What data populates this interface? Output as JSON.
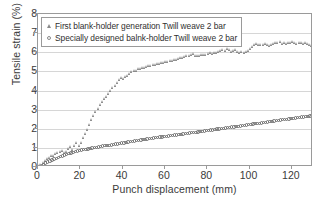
{
  "chart_data": {
    "type": "scatter",
    "title": "",
    "xlabel": "Punch displacement (mm)",
    "ylabel": "Tensile strain (%)",
    "xlim": [
      0,
      130
    ],
    "ylim": [
      0,
      8
    ],
    "xticks": [
      0,
      20,
      40,
      60,
      80,
      100,
      120
    ],
    "yticks": [
      0,
      1,
      2,
      3,
      4,
      5,
      6,
      7,
      8
    ],
    "grid": "horizontal",
    "legend_position": "upper-left-inside",
    "series": [
      {
        "name": "First blank-holder generation Twill weave 2 bar",
        "marker": "triangle",
        "color": "#7d7d7d",
        "x": [
          0.6,
          1.6,
          2.6,
          3.6,
          4.6,
          5.6,
          6.6,
          7.6,
          8.6,
          9.6,
          10.6,
          11.6,
          12.6,
          13.6,
          14.6,
          15.6,
          16.6,
          17.6,
          18.6,
          19.6,
          20.6,
          21.6,
          22.6,
          23.6,
          24.6,
          25.6,
          26.6,
          27.6,
          28.6,
          29.6,
          30.6,
          31.6,
          32.6,
          33.6,
          34.6,
          35.6,
          36.6,
          37.6,
          38.6,
          39.6,
          40.6,
          41.6,
          42.6,
          43.6,
          44.6,
          45.6,
          46.6,
          47.6,
          48.6,
          49.6,
          50.6,
          51.6,
          52.6,
          53.6,
          54.6,
          55.6,
          56.6,
          57.6,
          58.6,
          59.6,
          60.6,
          61.6,
          62.6,
          63.6,
          64.6,
          65.6,
          66.6,
          67.6,
          68.6,
          69.6,
          70.6,
          71.6,
          72.6,
          73.6,
          74.6,
          75.6,
          76.6,
          77.6,
          78.6,
          79.6,
          80.6,
          81.6,
          82.6,
          83.6,
          84.6,
          85.6,
          86.6,
          87.6,
          88.6,
          89.6,
          90.6,
          91.6,
          92.6,
          93.6,
          94.6,
          95.6,
          96.6,
          97.6,
          98.6,
          99.6,
          100.6,
          101.6,
          102.6,
          103.6,
          104.6,
          105.6,
          106.6,
          107.6,
          108.6,
          109.6,
          110.6,
          111.6,
          112.6,
          113.6,
          114.6,
          115.6,
          116.6,
          117.6,
          118.6,
          119.6,
          120.6,
          121.6,
          122.6,
          123.6,
          124.6,
          125.6,
          126.6,
          127.6,
          128.6,
          129.3
        ],
        "y": [
          0.05,
          0.12,
          0.22,
          0.32,
          0.42,
          0.5,
          0.58,
          0.62,
          0.7,
          0.74,
          0.8,
          0.86,
          0.74,
          0.82,
          0.96,
          1.06,
          0.92,
          1.12,
          1.26,
          1.1,
          1.28,
          1.52,
          1.74,
          1.96,
          2.2,
          2.46,
          2.68,
          2.88,
          3.08,
          3.26,
          3.42,
          3.56,
          3.7,
          3.86,
          4.02,
          4.14,
          4.26,
          4.4,
          4.56,
          4.68,
          4.62,
          4.72,
          4.8,
          4.9,
          4.98,
          5.02,
          5.06,
          5.12,
          5.14,
          5.18,
          5.2,
          5.24,
          5.28,
          5.3,
          5.34,
          5.36,
          5.4,
          5.42,
          5.44,
          5.46,
          5.5,
          5.52,
          5.56,
          5.58,
          5.62,
          5.64,
          5.66,
          5.7,
          5.72,
          5.76,
          5.8,
          5.84,
          5.86,
          5.92,
          5.84,
          5.8,
          5.82,
          5.86,
          5.88,
          5.9,
          5.92,
          5.96,
          5.94,
          6.0,
          5.98,
          6.04,
          6.08,
          6.14,
          6.1,
          6.18,
          6.14,
          6.06,
          6.1,
          6.14,
          6.04,
          6.0,
          6.06,
          5.98,
          6.04,
          6.1,
          6.18,
          6.3,
          6.42,
          6.46,
          6.4,
          6.42,
          6.38,
          6.44,
          6.4,
          6.36,
          6.42,
          6.46,
          6.52,
          6.48,
          6.54,
          6.44,
          6.5,
          6.46,
          6.52,
          6.48,
          6.54,
          6.5,
          6.44,
          6.48,
          6.52,
          6.46,
          6.5,
          6.44,
          6.4,
          6.34
        ]
      },
      {
        "name": "Specially designed balnk-holder Twill weave 2 bar",
        "marker": "circle",
        "color": "#6e6e6e",
        "x": [
          0.6,
          1.6,
          2.6,
          3.6,
          4.6,
          5.6,
          6.6,
          7.6,
          8.6,
          9.6,
          10.6,
          11.6,
          12.6,
          13.6,
          14.6,
          15.6,
          16.6,
          17.6,
          18.6,
          19.6,
          20.6,
          21.6,
          22.6,
          23.6,
          24.6,
          25.6,
          26.6,
          27.6,
          28.6,
          29.6,
          30.6,
          31.6,
          32.6,
          33.6,
          34.6,
          35.6,
          36.6,
          37.6,
          38.6,
          39.6,
          40.6,
          41.6,
          42.6,
          43.6,
          44.6,
          45.6,
          46.6,
          47.6,
          48.6,
          49.6,
          50.6,
          51.6,
          52.6,
          53.6,
          54.6,
          55.6,
          56.6,
          57.6,
          58.6,
          59.6,
          60.6,
          61.6,
          62.6,
          63.6,
          64.6,
          65.6,
          66.6,
          67.6,
          68.6,
          69.6,
          70.6,
          71.6,
          72.6,
          73.6,
          74.6,
          75.6,
          76.6,
          77.6,
          78.6,
          79.6,
          80.6,
          81.6,
          82.6,
          83.6,
          84.6,
          85.6,
          86.6,
          87.6,
          88.6,
          89.6,
          90.6,
          91.6,
          92.6,
          93.6,
          94.6,
          95.6,
          96.6,
          97.6,
          98.6,
          99.6,
          100.6,
          101.6,
          102.6,
          103.6,
          104.6,
          105.6,
          106.6,
          107.6,
          108.6,
          109.6,
          110.6,
          111.6,
          112.6,
          113.6,
          114.6,
          115.6,
          116.6,
          117.6,
          118.6,
          119.6,
          120.6,
          121.6,
          122.6,
          123.6,
          124.6,
          125.6,
          126.6,
          127.6,
          128.6,
          129.3
        ],
        "y": [
          0.04,
          0.08,
          0.14,
          0.2,
          0.26,
          0.32,
          0.36,
          0.42,
          0.46,
          0.5,
          0.54,
          0.58,
          0.62,
          0.66,
          0.7,
          0.74,
          0.76,
          0.8,
          0.84,
          0.86,
          0.88,
          0.9,
          0.93,
          0.95,
          0.97,
          0.99,
          1.01,
          1.03,
          1.05,
          1.07,
          1.09,
          1.11,
          1.13,
          1.14,
          1.16,
          1.18,
          1.2,
          1.21,
          1.23,
          1.25,
          1.26,
          1.28,
          1.3,
          1.32,
          1.34,
          1.36,
          1.38,
          1.4,
          1.42,
          1.43,
          1.45,
          1.47,
          1.48,
          1.5,
          1.51,
          1.53,
          1.54,
          1.56,
          1.57,
          1.59,
          1.61,
          1.62,
          1.64,
          1.65,
          1.67,
          1.68,
          1.7,
          1.71,
          1.73,
          1.74,
          1.76,
          1.77,
          1.79,
          1.8,
          1.82,
          1.84,
          1.85,
          1.87,
          1.88,
          1.9,
          1.91,
          1.93,
          1.94,
          1.96,
          1.98,
          1.99,
          2.01,
          2.02,
          2.04,
          2.05,
          2.07,
          2.09,
          2.1,
          2.12,
          2.13,
          2.15,
          2.17,
          2.18,
          2.2,
          2.21,
          2.23,
          2.25,
          2.26,
          2.28,
          2.29,
          2.31,
          2.33,
          2.34,
          2.36,
          2.37,
          2.39,
          2.41,
          2.42,
          2.44,
          2.45,
          2.47,
          2.49,
          2.5,
          2.52,
          2.53,
          2.55,
          2.56,
          2.58,
          2.59,
          2.61,
          2.62,
          2.64,
          2.65,
          2.67,
          2.68
        ]
      }
    ],
    "legend": [
      {
        "label": "First blank-holder generation Twill weave 2 bar",
        "marker": "triangle-icon"
      },
      {
        "label": "Specially designed balnk-holder Twill weave 2 bar",
        "marker": "circle-icon"
      }
    ]
  }
}
